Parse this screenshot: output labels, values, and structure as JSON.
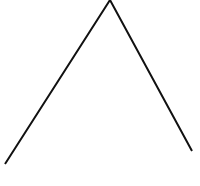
{
  "diagram": {
    "background": "#ffffff",
    "stroke_color": "#111111",
    "stroke_width": 2,
    "shape": "open-angle",
    "points": [
      {
        "x": 5,
        "y": 164
      },
      {
        "x": 110,
        "y": 0
      },
      {
        "x": 192,
        "y": 151
      }
    ]
  }
}
